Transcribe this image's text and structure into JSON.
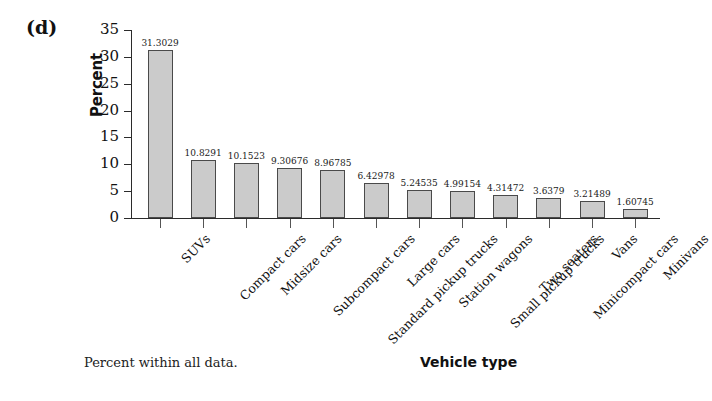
{
  "panel": {
    "label": "(d)"
  },
  "footnote": {
    "text": "Percent within all data."
  },
  "chart_data": {
    "type": "bar",
    "title": "",
    "subtitle": "",
    "xlabel": "Vehicle type",
    "ylabel": "Percent",
    "ylim": [
      0,
      35
    ],
    "ytick_step": 5,
    "yticks": [
      "35",
      "30",
      "25",
      "20",
      "15",
      "10",
      "5",
      "0"
    ],
    "grid": false,
    "legend": null,
    "bar_fill_color": "#cbcbcb",
    "bar_edge_color": "#4a4a4a",
    "axis_color": "#2b2b2b",
    "background_color": "#ffffff",
    "categories": [
      "SUVs",
      "Compact cars",
      "Midsize cars",
      "Subcompact cars",
      "Standard pickup trucks",
      "Large cars",
      "Station wagons",
      "Small pickup trucks",
      "Two seaters",
      "Minicompact cars",
      "Vans",
      "Minivans"
    ],
    "values": [
      31.3029,
      10.8291,
      10.1523,
      9.30676,
      8.96785,
      6.42978,
      5.24535,
      4.99154,
      4.31472,
      3.6379,
      3.21489,
      1.60745
    ],
    "value_labels": [
      "31.3029",
      "10.8291",
      "10.1523",
      "9.30676",
      "8.96785",
      "6.42978",
      "5.24535",
      "4.99154",
      "4.31472",
      "3.6379",
      "3.21489",
      "1.60745"
    ]
  }
}
